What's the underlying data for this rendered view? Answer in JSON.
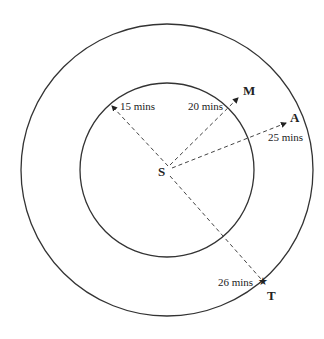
{
  "diagram": {
    "type": "concentric-circles-travel-time",
    "colors": {
      "stroke": "#333333",
      "text": "#222222",
      "background": "#ffffff"
    },
    "center": {
      "label": "S"
    },
    "circles": [
      {
        "name": "inner",
        "radius_px": 87
      },
      {
        "name": "outer",
        "radius_px": 146
      }
    ],
    "routes": [
      {
        "id": "r15",
        "label": "15 mins",
        "target": ""
      },
      {
        "id": "r20",
        "label": "20 mins",
        "target": "M"
      },
      {
        "id": "r25",
        "label": "25 mins",
        "target": "A"
      },
      {
        "id": "r26",
        "label": "26 mins",
        "target": "T"
      }
    ]
  }
}
